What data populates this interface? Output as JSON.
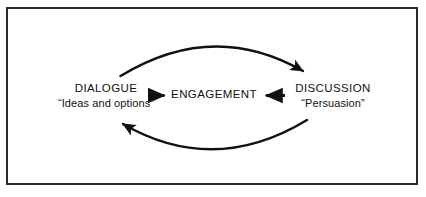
{
  "diagram": {
    "frame": {
      "border_color": "#2b2b2b",
      "background_color": "#ffffff"
    },
    "ink_color": "#111111",
    "nodes": {
      "dialogue": {
        "title": "DIALOGUE",
        "subtitle": "“Ideas and options”"
      },
      "engagement": {
        "title": "ENGAGEMENT"
      },
      "discussion": {
        "title": "DISCUSSION",
        "subtitle": "“Persuasion”"
      }
    },
    "connectors": [
      {
        "name": "dialogue-to-engagement-arrow",
        "from": "DIALOGUE",
        "to": "ENGAGEMENT",
        "style": "straight",
        "direction": "right"
      },
      {
        "name": "discussion-to-engagement-arrow",
        "from": "DISCUSSION",
        "to": "ENGAGEMENT",
        "style": "straight",
        "direction": "left"
      },
      {
        "name": "dialogue-to-discussion-arc",
        "from": "DIALOGUE",
        "to": "DISCUSSION",
        "style": "curved",
        "direction": "right",
        "position": "top"
      },
      {
        "name": "discussion-to-dialogue-arc",
        "from": "DISCUSSION",
        "to": "DIALOGUE",
        "style": "curved",
        "direction": "left",
        "position": "bottom"
      }
    ]
  }
}
